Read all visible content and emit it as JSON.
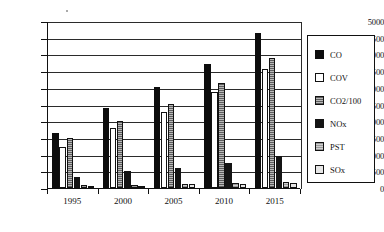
{
  "chart_data": {
    "type": "bar",
    "title": "",
    "xlabel": "",
    "ylabel": "",
    "categories": [
      "1995",
      "2000",
      "2005",
      "2010",
      "2015"
    ],
    "ylim": [
      0,
      5000
    ],
    "ytick_step": 500,
    "yticks": [
      "5000",
      "4500",
      "4000",
      "3500",
      "3000",
      "2500",
      "2000",
      "1500",
      "1000",
      "500",
      "0"
    ],
    "grid": true,
    "legend_position": "right",
    "series": [
      {
        "name": "CO",
        "color": "#0d0d0d",
        "values": [
          1640,
          2400,
          3020,
          3720,
          4650
        ]
      },
      {
        "name": "COV",
        "color": "#ffffff",
        "values": [
          1240,
          1800,
          2280,
          2880,
          3560
        ]
      },
      {
        "name": "CO2/100",
        "color": "#8e8e8e",
        "values": [
          1500,
          2010,
          2520,
          3140,
          3900
        ]
      },
      {
        "name": "NOx",
        "color": "#141414",
        "values": [
          330,
          520,
          610,
          760,
          960
        ]
      },
      {
        "name": "PST",
        "color": "#b5b5b5",
        "values": [
          90,
          100,
          120,
          150,
          180
        ]
      },
      {
        "name": "SOx",
        "color": "#e6e6e6",
        "values": [
          60,
          70,
          110,
          130,
          160
        ]
      }
    ]
  }
}
